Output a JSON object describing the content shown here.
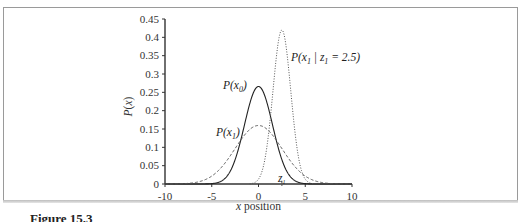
{
  "figure": {
    "caption_visible": "Figure 15.3",
    "frame_color": "#9a9a9a"
  },
  "chart_data": {
    "type": "line",
    "title": "",
    "xlabel": "x position",
    "ylabel": "P(x)",
    "xlim": [
      -10,
      10
    ],
    "ylim": [
      0,
      0.45
    ],
    "xticks": [
      -10,
      -5,
      0,
      5,
      10
    ],
    "yticks": [
      0,
      0.05,
      0.1,
      0.15,
      0.2,
      0.25,
      0.3,
      0.35,
      0.4,
      0.45
    ],
    "xtick_labels": [
      "-10",
      "-5",
      "0",
      "5",
      "10"
    ],
    "ytick_labels": [
      "0",
      "0.05",
      "0.1",
      "0.15",
      "0.2",
      "0.25",
      "0.3",
      "0.35",
      "0.4",
      "0.45"
    ],
    "grid": false,
    "legend": "inline labels",
    "annotations": [
      {
        "text": "z1",
        "x": 2.5,
        "y": 0,
        "marker": "tick"
      }
    ],
    "series": [
      {
        "name": "P(x0)",
        "style": "solid",
        "mean": 0,
        "sigma": 1.5,
        "peak": 0.266
      },
      {
        "name": "P(x1)",
        "style": "dashed",
        "mean": 0,
        "sigma": 2.5,
        "peak": 0.16
      },
      {
        "name": "P(x1 | z1 = 2.5)",
        "style": "dotted",
        "mean": 2.5,
        "sigma": 0.95,
        "peak": 0.42
      }
    ]
  },
  "labels": {
    "px0": "P(x",
    "px0_sub": "0",
    "px1": "P(x",
    "px1_sub": "1",
    "post_prefix": "P(x",
    "post_sub1": "1",
    "post_mid": " | z",
    "post_sub2": "1",
    "post_suffix": " = 2.5)",
    "close": ")",
    "z1": "z",
    "z1_sub": "1"
  }
}
